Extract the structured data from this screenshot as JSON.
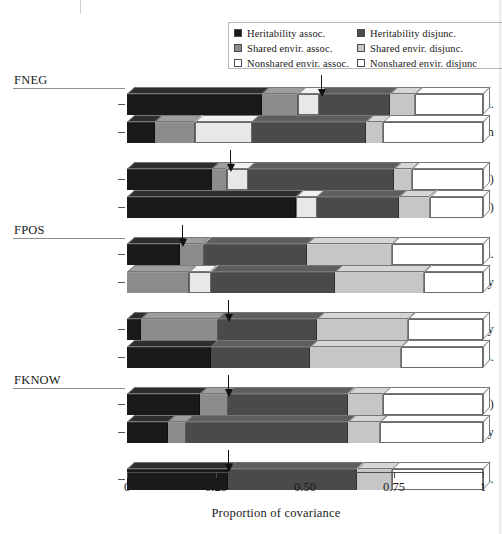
{
  "legend": {
    "columns": [
      {
        "items": [
          {
            "label": "Heritability assoc.",
            "color": "#1a1a1a",
            "name": "heritability-assoc"
          },
          {
            "label": "Shared envir. assoc.",
            "color": "#8c8c8c",
            "name": "shared-envir-assoc"
          },
          {
            "label": "Nonshared envir. assoc.",
            "color": "#ffffff",
            "name": "nonshared-envir-assoc"
          }
        ]
      },
      {
        "items": [
          {
            "label": "Heritability disjunc.",
            "color": "#4a4a4a",
            "name": "heritability-disjunc"
          },
          {
            "label": "Shared envir. disjunc.",
            "color": "#c6c6c6",
            "name": "shared-envir-disjunc"
          },
          {
            "label": "Nonshared envir. disjunc",
            "color": "#ffffff",
            "name": "nonshared-envir-disjunc"
          }
        ]
      }
    ]
  },
  "axis": {
    "title": "Proportion of covariance",
    "ticks": [
      "0",
      "0.25",
      "0.50",
      "0.75",
      "1"
    ],
    "tick_values": [
      0,
      0.25,
      0.5,
      0.75,
      1
    ],
    "min": 0,
    "max": 1
  },
  "groups": [
    {
      "title": "FNEG",
      "rows": [
        "Antisocial beh.",
        "Depression"
      ]
    },
    {
      "title": "",
      "rows": [
        "Cog. agency (-)",
        "Social respons. (-)"
      ]
    },
    {
      "title": "FPOS",
      "rows": [
        "Antisocial beh.",
        "Sociability"
      ]
    },
    {
      "title": "",
      "rows": [
        "Autonomy",
        "Social respons."
      ]
    },
    {
      "title": "FKNOW",
      "rows": [
        "Antisocial beh. (-)",
        "Cog. agency"
      ]
    },
    {
      "title": "",
      "rows": [
        "Social respons."
      ]
    }
  ],
  "chart_data": {
    "type": "bar",
    "orientation": "horizontal",
    "stacked": true,
    "title": "",
    "xlabel": "Proportion of covariance",
    "ylabel": "",
    "xlim": [
      0,
      1
    ],
    "grid": false,
    "legend_position": "top-right",
    "series": [
      {
        "name": "Heritability assoc.",
        "color": "#1a1a1a"
      },
      {
        "name": "Shared envir. assoc.",
        "color": "#8c8c8c"
      },
      {
        "name": "Nonshared envir. assoc.",
        "color": "#e8e8e8"
      },
      {
        "name": "Heritability disjunc.",
        "color": "#4a4a4a"
      },
      {
        "name": "Shared envir. disjunc.",
        "color": "#c6c6c6"
      },
      {
        "name": "Nonshared envir. disjunc",
        "color": "#ffffff"
      }
    ],
    "bars": [
      {
        "group": "FNEG",
        "category": "Antisocial beh.",
        "values": [
          0.38,
          0.1,
          0.06,
          0.2,
          0.07,
          0.19
        ],
        "arrow_at": 0.545
      },
      {
        "group": "FNEG",
        "category": "Depression",
        "values": [
          0.08,
          0.11,
          0.16,
          0.32,
          0.05,
          0.28
        ],
        "arrow_at": null
      },
      {
        "group": "",
        "category": "Cog. agency (-)",
        "values": [
          0.24,
          0.04,
          0.06,
          0.41,
          0.05,
          0.2
        ],
        "arrow_at": 0.29
      },
      {
        "group": "",
        "category": "Social respons. (-)",
        "values": [
          0.475,
          0.0,
          0.06,
          0.23,
          0.085,
          0.15
        ],
        "arrow_at": null
      },
      {
        "group": "FPOS",
        "category": "Antisocial beh.",
        "values": [
          0.15,
          0.065,
          0.0,
          0.29,
          0.24,
          0.255
        ],
        "arrow_at": 0.155
      },
      {
        "group": "FPOS",
        "category": "Sociability",
        "values": [
          0.0,
          0.175,
          0.06,
          0.35,
          0.25,
          0.165
        ],
        "arrow_at": null
      },
      {
        "group": "",
        "category": "Autonomy",
        "values": [
          0.04,
          0.215,
          0.0,
          0.28,
          0.255,
          0.21
        ],
        "arrow_at": 0.285
      },
      {
        "group": "",
        "category": "Social respons.",
        "values": [
          0.235,
          0.0,
          0.0,
          0.28,
          0.255,
          0.23
        ],
        "arrow_at": null
      },
      {
        "group": "FKNOW",
        "category": "Antisocial beh. (-)",
        "values": [
          0.205,
          0.08,
          0.0,
          0.335,
          0.1,
          0.28
        ],
        "arrow_at": 0.285
      },
      {
        "group": "FKNOW",
        "category": "Cog. agency",
        "values": [
          0.115,
          0.05,
          0.0,
          0.455,
          0.09,
          0.29
        ],
        "arrow_at": null
      },
      {
        "group": "",
        "category": "Social respons.",
        "values": [
          0.285,
          0.0,
          0.0,
          0.36,
          0.1,
          0.255
        ],
        "arrow_at": 0.285
      }
    ]
  }
}
